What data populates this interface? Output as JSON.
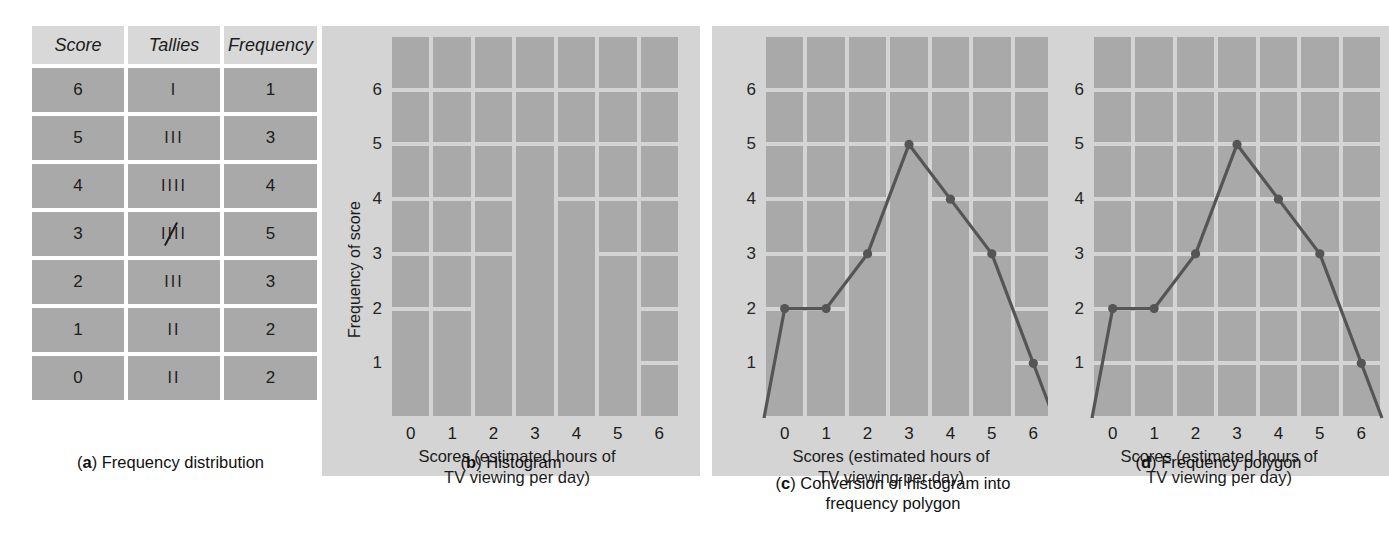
{
  "figure": {
    "background": "#ffffff",
    "panel_bg": "#d4d4d4",
    "cell_fill": "#a9a9a9",
    "gridline": "#f2f2f2",
    "line_color": "#555555"
  },
  "panel_a": {
    "caption_letter": "a",
    "caption_text": ") Frequency distribution",
    "columns": [
      "Score",
      "Tallies",
      "Frequency"
    ],
    "rows": [
      {
        "score": "6",
        "tallies": "I",
        "tally_count": 1,
        "frequency": "1"
      },
      {
        "score": "5",
        "tallies": "III",
        "tally_count": 3,
        "frequency": "3"
      },
      {
        "score": "4",
        "tallies": "IIII",
        "tally_count": 4,
        "frequency": "4"
      },
      {
        "score": "3",
        "tallies": "IIII",
        "tally_count": 5,
        "frequency": "5"
      },
      {
        "score": "2",
        "tallies": "III",
        "tally_count": 3,
        "frequency": "3"
      },
      {
        "score": "1",
        "tallies": "II",
        "tally_count": 2,
        "frequency": "2"
      },
      {
        "score": "0",
        "tallies": "II",
        "tally_count": 2,
        "frequency": "2"
      }
    ]
  },
  "panel_b": {
    "caption_letter": "b",
    "caption_text": ") Histogram",
    "ylabel": "Frequency of score",
    "xlabel": "Scores (estimated hours of\nTV viewing per day)",
    "yticks": [
      "1",
      "2",
      "3",
      "4",
      "5",
      "6"
    ],
    "xticks": [
      "0",
      "1",
      "2",
      "3",
      "4",
      "5",
      "6"
    ]
  },
  "panel_c": {
    "caption_letter": "c",
    "caption_text": ") Conversion of histogram into\nfrequency polygon",
    "xlabel": "Scores (estimated hours of\nTV viewing per day)",
    "yticks": [
      "1",
      "2",
      "3",
      "4",
      "5",
      "6"
    ],
    "xticks": [
      "0",
      "1",
      "2",
      "3",
      "4",
      "5",
      "6"
    ]
  },
  "panel_d": {
    "caption_letter": "d",
    "caption_text": ") Frequency polygon",
    "xlabel": "Scores (estimated hours of\nTV viewing per day)",
    "yticks": [
      "1",
      "2",
      "3",
      "4",
      "5",
      "6"
    ],
    "xticks": [
      "0",
      "1",
      "2",
      "3",
      "4",
      "5",
      "6"
    ]
  },
  "chart_data": [
    {
      "type": "table",
      "title": "(a) Frequency distribution",
      "columns": [
        "Score",
        "Tallies",
        "Frequency"
      ],
      "rows": [
        [
          "6",
          "I",
          "1"
        ],
        [
          "5",
          "III",
          "3"
        ],
        [
          "4",
          "IIII",
          "4"
        ],
        [
          "3",
          "IIII/",
          "5"
        ],
        [
          "2",
          "III",
          "3"
        ],
        [
          "1",
          "II",
          "2"
        ],
        [
          "0",
          "II",
          "2"
        ]
      ]
    },
    {
      "type": "bar",
      "title": "(b) Histogram",
      "categories": [
        0,
        1,
        2,
        3,
        4,
        5,
        6
      ],
      "values": [
        2,
        2,
        3,
        5,
        4,
        3,
        1
      ],
      "xlabel": "Scores (estimated hours of TV viewing per day)",
      "ylabel": "Frequency of score",
      "ylim": [
        0,
        7
      ],
      "yticks": [
        1,
        2,
        3,
        4,
        5,
        6
      ],
      "grid": true
    },
    {
      "type": "bar",
      "title": "(c) Conversion of histogram into frequency polygon",
      "categories": [
        0,
        1,
        2,
        3,
        4,
        5,
        6
      ],
      "values": [
        2,
        2,
        3,
        5,
        4,
        3,
        1
      ],
      "overlay": {
        "type": "line",
        "name": "frequency polygon",
        "x": [
          -0.5,
          0,
          1,
          2,
          3,
          4,
          5,
          6,
          6.5
        ],
        "y": [
          0,
          2,
          2,
          3,
          5,
          4,
          3,
          1,
          0
        ],
        "markers_at": [
          [
            0,
            2
          ],
          [
            1,
            2
          ],
          [
            2,
            3
          ],
          [
            3,
            5
          ],
          [
            4,
            4
          ],
          [
            5,
            3
          ],
          [
            6,
            1
          ]
        ]
      },
      "xlabel": "Scores (estimated hours of TV viewing per day)",
      "ylabel": "Frequency of score",
      "ylim": [
        0,
        7
      ],
      "yticks": [
        1,
        2,
        3,
        4,
        5,
        6
      ],
      "grid": true
    },
    {
      "type": "line",
      "title": "(d) Frequency polygon",
      "x": [
        -0.5,
        0,
        1,
        2,
        3,
        4,
        5,
        6,
        6.5
      ],
      "y": [
        0,
        2,
        2,
        3,
        5,
        4,
        3,
        1,
        0
      ],
      "markers_at": [
        [
          0,
          2
        ],
        [
          1,
          2
        ],
        [
          2,
          3
        ],
        [
          3,
          5
        ],
        [
          4,
          4
        ],
        [
          5,
          3
        ],
        [
          6,
          1
        ]
      ],
      "xlabel": "Scores (estimated hours of TV viewing per day)",
      "ylabel": "Frequency of score",
      "ylim": [
        0,
        7
      ],
      "yticks": [
        1,
        2,
        3,
        4,
        5,
        6
      ],
      "grid": true
    }
  ]
}
